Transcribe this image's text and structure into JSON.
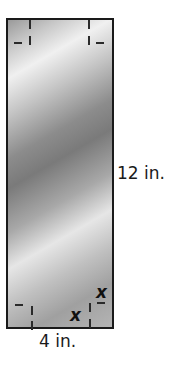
{
  "figure": {
    "width_label": "4 in.",
    "height_label": "12 in.",
    "corner_variable": "x",
    "corner_variable_2": "x"
  }
}
